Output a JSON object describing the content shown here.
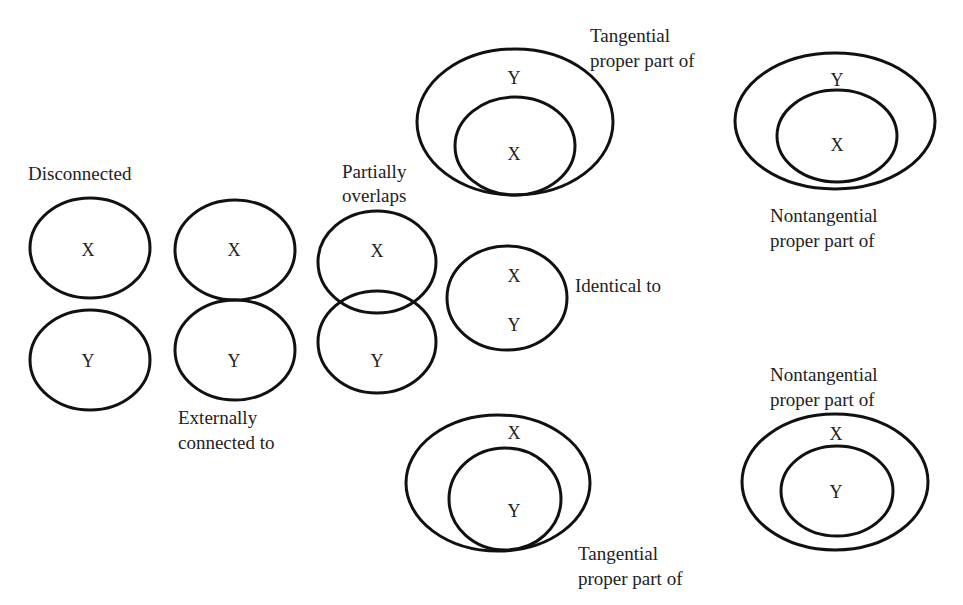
{
  "diagram": {
    "type": "RCC8 spatial relations",
    "relations": [
      {
        "id": "disconnected",
        "label": "Disconnected",
        "regions": [
          {
            "name": "X",
            "cx": 90,
            "cy": 248,
            "rx": 60,
            "ry": 50
          },
          {
            "name": "Y",
            "cx": 90,
            "cy": 360,
            "rx": 60,
            "ry": 50
          }
        ]
      },
      {
        "id": "externally-connected",
        "label_line1": "Externally",
        "label_line2": "connected to",
        "regions": [
          {
            "name": "X",
            "cx": 235,
            "cy": 250,
            "rx": 60,
            "ry": 50
          },
          {
            "name": "Y",
            "cx": 235,
            "cy": 350,
            "rx": 60,
            "ry": 50
          }
        ]
      },
      {
        "id": "partially-overlaps",
        "label_line1": "Partially",
        "label_line2": "overlaps",
        "regions": [
          {
            "name": "X",
            "cx": 377,
            "cy": 262,
            "rx": 59,
            "ry": 51
          },
          {
            "name": "Y",
            "cx": 377,
            "cy": 342,
            "rx": 59,
            "ry": 51
          }
        ]
      },
      {
        "id": "identical",
        "label": "Identical to",
        "regions": [
          {
            "name": "X",
            "cx": 507,
            "cy": 298,
            "rx": 60,
            "ry": 52,
            "text_y": 276
          },
          {
            "name": "Y",
            "text_y": 325
          }
        ]
      },
      {
        "id": "tangential-proper-part-top",
        "label_line1": "Tangential",
        "label_line2": "proper part of",
        "outer": {
          "name": "Y",
          "cx": 515,
          "cy": 122,
          "rx": 98,
          "ry": 73,
          "text_y": 78
        },
        "inner": {
          "name": "X",
          "cx": 515,
          "cy": 146,
          "rx": 60,
          "ry": 49,
          "text_y": 153
        }
      },
      {
        "id": "nontangential-proper-part-top",
        "label_line1": "Nontangential",
        "label_line2": "proper part of",
        "outer": {
          "name": "Y",
          "cx": 835,
          "cy": 121,
          "rx": 100,
          "ry": 68,
          "text_y": 80
        },
        "inner": {
          "name": "X",
          "cx": 837,
          "cy": 136,
          "rx": 60,
          "ry": 46,
          "text_y": 145
        }
      },
      {
        "id": "tangential-proper-part-bottom",
        "label_line1": "Tangential",
        "label_line2": "proper part of",
        "outer": {
          "name": "X",
          "cx": 498,
          "cy": 483,
          "rx": 92,
          "ry": 68,
          "text_y": 432
        },
        "inner": {
          "name": "Y",
          "cx": 505,
          "cy": 499,
          "rx": 56,
          "ry": 51,
          "text_y": 511
        }
      },
      {
        "id": "nontangential-proper-part-bottom",
        "label_line1": "Nontangential",
        "label_line2": "proper part of",
        "outer": {
          "name": "X",
          "cx": 835,
          "cy": 482,
          "rx": 93,
          "ry": 68,
          "text_y": 433
        },
        "inner": {
          "name": "Y",
          "cx": 837,
          "cy": 491,
          "rx": 56,
          "ry": 45,
          "text_y": 492
        }
      }
    ]
  },
  "labels": {
    "disconnected": "Disconnected",
    "ext_1": "Externally",
    "ext_2": "connected to",
    "partial_1": "Partially",
    "partial_2": "overlaps",
    "identical": "Identical to",
    "tpp_top_1": "Tangential",
    "tpp_top_2": "proper part of",
    "ntpp_top_1": "Nontangential",
    "ntpp_top_2": "proper part of",
    "tpp_bot_1": "Tangential",
    "tpp_bot_2": "proper part of",
    "ntpp_bot_1": "Nontangential",
    "ntpp_bot_2": "proper part of"
  },
  "region_names": {
    "x": "X",
    "y": "Y"
  },
  "colors": {
    "stroke": "#111111",
    "background": "#ffffff",
    "text": "#222222"
  }
}
